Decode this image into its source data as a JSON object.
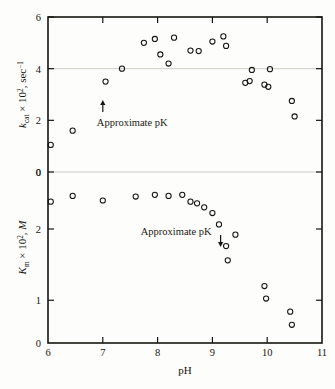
{
  "figure": {
    "xlabel": "pH",
    "panels": {
      "upper": {
        "ylabel_symbol": "k",
        "ylabel_sub": "cat",
        "ylabel_mid": " × 10",
        "ylabel_sup": "2",
        "ylabel_tail": ", sec",
        "ylabel_sup2": "−1",
        "ylabel_full": "kcat × 10², sec⁻¹",
        "annotation": "Approximate pK",
        "annotation_ph": 7.0
      },
      "lower": {
        "ylabel_symbol": "K",
        "ylabel_sub": "m",
        "ylabel_mid": " × 10",
        "ylabel_sup": "2",
        "ylabel_tail": ", M",
        "ylabel_full": "Km × 10², M",
        "annotation": "Approximate pK",
        "annotation_ph": 9.15
      }
    }
  },
  "chart_data": {
    "type": "scatter",
    "title": "",
    "xlabel": "pH",
    "x_ticks": [
      6,
      7,
      8,
      9,
      10,
      11
    ],
    "xlim": [
      6,
      11
    ],
    "grid": "horizontal-faint",
    "legend": "none",
    "marker_style": "open-circle",
    "panels": [
      {
        "name": "upper",
        "ylabel": "kcat × 10², sec⁻¹",
        "y_ticks": [
          0,
          2,
          4,
          6
        ],
        "ylim": [
          0,
          6
        ],
        "y_axis_direction": "normal",
        "gridlines_at": [
          0,
          4
        ],
        "annotation": {
          "text": "Approximate pK",
          "x": 7.0,
          "arrow": "up"
        },
        "points": [
          {
            "x": 6.05,
            "y": 1.05
          },
          {
            "x": 6.45,
            "y": 1.6
          },
          {
            "x": 7.05,
            "y": 3.5
          },
          {
            "x": 7.35,
            "y": 4.0
          },
          {
            "x": 7.75,
            "y": 5.0
          },
          {
            "x": 7.95,
            "y": 5.15
          },
          {
            "x": 8.05,
            "y": 4.55
          },
          {
            "x": 8.2,
            "y": 4.2
          },
          {
            "x": 8.3,
            "y": 5.2
          },
          {
            "x": 8.6,
            "y": 4.7
          },
          {
            "x": 8.75,
            "y": 4.68
          },
          {
            "x": 9.0,
            "y": 5.05
          },
          {
            "x": 9.2,
            "y": 5.25
          },
          {
            "x": 9.25,
            "y": 4.88
          },
          {
            "x": 9.6,
            "y": 3.45
          },
          {
            "x": 9.68,
            "y": 3.52
          },
          {
            "x": 9.72,
            "y": 3.95
          },
          {
            "x": 9.95,
            "y": 3.38
          },
          {
            "x": 10.02,
            "y": 3.3
          },
          {
            "x": 10.05,
            "y": 3.98
          },
          {
            "x": 10.45,
            "y": 2.75
          },
          {
            "x": 10.5,
            "y": 2.15
          }
        ]
      },
      {
        "name": "lower",
        "ylabel": "Km × 10², M",
        "y_ticks": [
          0,
          2,
          1,
          0
        ],
        "y_tick_labels": [
          "0",
          "2",
          "1",
          "0"
        ],
        "ylim": [
          0,
          3
        ],
        "y_axis_direction": "inverted",
        "gridlines_at": [],
        "annotation": {
          "text": "Approximate pK",
          "x": 9.15,
          "arrow": "down"
        },
        "points": [
          {
            "x": 6.05,
            "y": 0.52
          },
          {
            "x": 6.45,
            "y": 0.42
          },
          {
            "x": 7.0,
            "y": 0.5
          },
          {
            "x": 7.6,
            "y": 0.43
          },
          {
            "x": 7.95,
            "y": 0.4
          },
          {
            "x": 8.2,
            "y": 0.42
          },
          {
            "x": 8.45,
            "y": 0.4
          },
          {
            "x": 8.6,
            "y": 0.52
          },
          {
            "x": 8.72,
            "y": 0.55
          },
          {
            "x": 8.85,
            "y": 0.62
          },
          {
            "x": 9.0,
            "y": 0.72
          },
          {
            "x": 9.12,
            "y": 0.92
          },
          {
            "x": 9.25,
            "y": 1.3
          },
          {
            "x": 9.28,
            "y": 1.55
          },
          {
            "x": 9.42,
            "y": 1.1
          },
          {
            "x": 9.95,
            "y": 2.0
          },
          {
            "x": 9.98,
            "y": 2.22
          },
          {
            "x": 10.42,
            "y": 2.45
          },
          {
            "x": 10.45,
            "y": 2.68
          }
        ]
      }
    ]
  }
}
